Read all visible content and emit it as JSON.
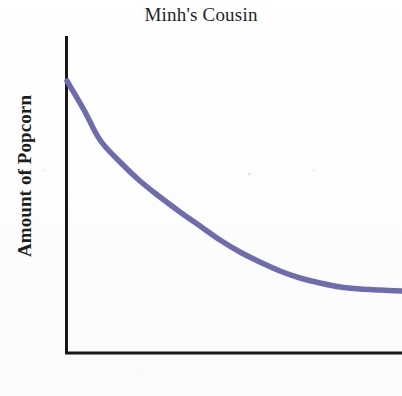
{
  "figure": {
    "width": 402,
    "height": 396,
    "background_color": "#fefefe"
  },
  "chart_data": {
    "type": "line",
    "title": "Minh's Cousin",
    "subtitle": "",
    "xlabel": "Time",
    "ylabel": "Amount of Popcorn",
    "grid": false,
    "legend": false,
    "legend_position": "none",
    "x_tick_labels": [],
    "y_tick_labels": [],
    "xlim": [
      0,
      1
    ],
    "ylim": [
      0,
      1
    ],
    "axis_color": "#1a1614",
    "axis_line_width": 3,
    "series": [
      {
        "name": "Amount of Popcorn",
        "color": "#6e6cad",
        "line_width": 5.5,
        "shape": "exponential-decay",
        "x": [
          0.0,
          0.05,
          0.1,
          0.15,
          0.2,
          0.25,
          0.3,
          0.35,
          0.4,
          0.45,
          0.5,
          0.55,
          0.6,
          0.65,
          0.7,
          0.75,
          0.8,
          0.85,
          0.9,
          0.95,
          1.0
        ],
        "y": [
          1.0,
          0.855,
          0.735,
          0.636,
          0.554,
          0.486,
          0.429,
          0.382,
          0.343,
          0.311,
          0.284,
          0.262,
          0.243,
          0.228,
          0.215,
          0.205,
          0.196,
          0.189,
          0.183,
          0.179,
          0.175
        ],
        "pixel_points": [
          [
            67,
            81
          ],
          [
            84,
            110
          ],
          [
            100,
            140
          ],
          [
            120,
            162
          ],
          [
            140,
            181
          ],
          [
            160,
            197
          ],
          [
            180,
            212
          ],
          [
            200,
            226
          ],
          [
            220,
            240
          ],
          [
            240,
            252
          ],
          [
            260,
            262
          ],
          [
            280,
            271
          ],
          [
            300,
            278
          ],
          [
            320,
            283
          ],
          [
            340,
            287
          ],
          [
            360,
            289
          ],
          [
            380,
            290
          ],
          [
            402,
            291
          ]
        ]
      }
    ]
  },
  "axes": {
    "y_axis": {
      "x": 66,
      "y_top": 36,
      "y_bottom": 354
    },
    "x_axis": {
      "y": 353,
      "x_left": 65,
      "x_right": 402
    }
  }
}
